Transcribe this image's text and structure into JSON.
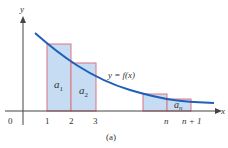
{
  "figure": {
    "caption": "(a)",
    "curve_label": "y = f(x)",
    "axes": {
      "x_label": "x",
      "y_label": "y",
      "origin_label": "0"
    },
    "x_ticks": [
      "1",
      "2",
      "3",
      "n",
      "n + 1"
    ],
    "rect_labels": {
      "a1": "a",
      "a1_sub": "1",
      "a2": "a",
      "a2_sub": "2",
      "an": "a",
      "an_sub": "n"
    },
    "colors": {
      "curve": "#1f5fb8",
      "rect_fill": "#c5dcf3",
      "rect_stroke": "#e07080",
      "axis": "#444444"
    }
  }
}
